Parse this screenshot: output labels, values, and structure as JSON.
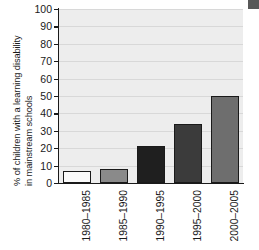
{
  "chart_data": {
    "type": "bar",
    "title": "",
    "xlabel": "",
    "ylabel": "% of children with a learning disability in mainstream schools",
    "ylabel_lines": [
      "% of children with a learning disability",
      "in mainstream schools"
    ],
    "categories": [
      "1980–1985",
      "1985–1990",
      "1990–1995",
      "1995–2000",
      "2000–2005"
    ],
    "values": [
      7,
      8,
      21,
      34,
      50
    ],
    "ylim": [
      0,
      100
    ],
    "ytick_labels": [
      "100",
      "90",
      "80",
      "70",
      "60",
      "50",
      "40",
      "30",
      "20",
      "10",
      "0"
    ],
    "ytick_values": [
      100,
      90,
      80,
      70,
      60,
      50,
      40,
      30,
      20,
      10,
      0
    ],
    "grid": true,
    "legend": "none",
    "bar_colors": [
      "#fafafa",
      "#8a8a8a",
      "#1f1f1f",
      "#3b3b3b",
      "#6e6e6e"
    ],
    "bar_edge_color": "#1a1a1a",
    "plot_background": "#ededed",
    "gridline_color": "#d8d8d8",
    "axis_color": "#1a1a1a"
  },
  "marks": {
    "corner_block_color": "#585858"
  }
}
